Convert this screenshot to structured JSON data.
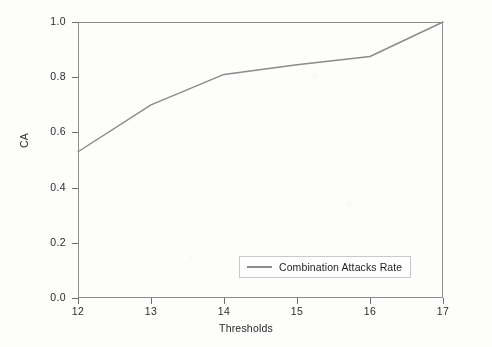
{
  "chart_data": {
    "type": "line",
    "title": "",
    "subtitle": "",
    "xlabel": "Thresholds",
    "ylabel": "CA",
    "xlim": [
      12,
      17
    ],
    "ylim": [
      0.0,
      1.0
    ],
    "grid": false,
    "legend_position": "lower right (inside axes)",
    "x": [
      12,
      13,
      14,
      15,
      16,
      17
    ],
    "xtick_labels": [
      "12",
      "13",
      "14",
      "15",
      "16",
      "17"
    ],
    "ytick_values": [
      0.0,
      0.2,
      0.4,
      0.6,
      0.8,
      1.0
    ],
    "ytick_labels": [
      "0.0",
      "0.2",
      "0.4",
      "0.6",
      "0.8",
      "1.0"
    ],
    "series": [
      {
        "name": "Combination Attacks Rate",
        "color": "#8a8a8a",
        "values": [
          0.53,
          0.7,
          0.81,
          0.845,
          0.875,
          1.0
        ]
      }
    ],
    "legend_entries": [
      "Combination Attacks Rate"
    ]
  },
  "axes": {
    "frame_color": "#8d8d8d"
  }
}
